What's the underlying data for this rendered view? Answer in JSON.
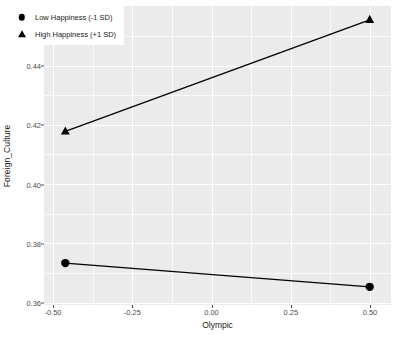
{
  "chart_data": {
    "type": "line",
    "title": "",
    "xlabel": "Olympic",
    "ylabel": "Foreign_Culture",
    "x": [
      -0.5,
      0.5
    ],
    "xlim": [
      -0.57,
      0.57
    ],
    "ylim": [
      0.3565,
      0.4585
    ],
    "xticks": [
      -0.5,
      -0.25,
      0,
      0.25,
      0.5
    ],
    "xticklabels": [
      "-0.50",
      "-0.25",
      "0.00",
      "0.25",
      "0.50"
    ],
    "yticks": [
      0.36,
      0.38,
      0.4,
      0.42,
      0.44
    ],
    "yticklabels": [
      "0.36",
      "0.38",
      "0.40",
      "0.42",
      "0.44"
    ],
    "grid": true,
    "minor_grid": true,
    "legend_position": "top-left",
    "series": [
      {
        "name": "Low Happiness (-1 SD)",
        "marker": "circle",
        "color": "#000000",
        "values": [
          0.3708,
          0.3627
        ]
      },
      {
        "name": "High Happiness (+1 SD)",
        "marker": "triangle",
        "color": "#000000",
        "values": [
          0.4157,
          0.4538
        ]
      }
    ]
  },
  "axes": {
    "y_title": "Foreign_Culture",
    "x_title": "Olympic",
    "y_tick_0": "0.36",
    "y_tick_1": "0.38",
    "y_tick_2": "0.40",
    "y_tick_3": "0.42",
    "y_tick_4": "0.44",
    "x_tick_0": "-0.50",
    "x_tick_1": "-0.25",
    "x_tick_2": "0.00",
    "x_tick_3": "0.25",
    "x_tick_4": "0.50"
  },
  "legend": {
    "entries": [
      {
        "label": "Low Happiness (-1 SD)",
        "marker": "circle"
      },
      {
        "label": "High Happiness (+1 SD)",
        "marker": "triangle"
      }
    ]
  },
  "colors": {
    "panel_background": "#ebebeb",
    "grid_major": "#ffffff",
    "grid_minor": "#fafafa",
    "series_line": "#000000",
    "text": "#1a1a1a",
    "tick_text": "#4d4d4d"
  }
}
